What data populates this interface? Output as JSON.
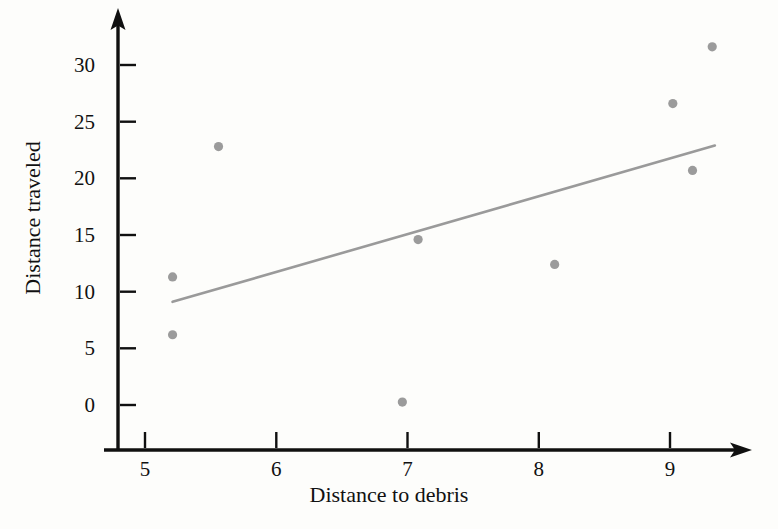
{
  "chart_data": {
    "type": "scatter",
    "title": "",
    "xlabel": "Distance to debris",
    "ylabel": "Distance traveled",
    "xlim": [
      4.62,
      9.95
    ],
    "ylim": [
      -4.0,
      33.5
    ],
    "grid": false,
    "legend": false,
    "xticks": [
      "5",
      "6",
      "7",
      "8",
      "9"
    ],
    "xtick_values": [
      5,
      6,
      7,
      8,
      9
    ],
    "yticks": [
      "0",
      "5",
      "10",
      "15",
      "20",
      "25",
      "30"
    ],
    "ytick_values": [
      0,
      5,
      10,
      15,
      20,
      25,
      30
    ],
    "point_color": "#9b9b9b",
    "line_color": "#9a9a9a",
    "axis_color": "#101010",
    "background": "#fdfdfb",
    "x": [
      5.21,
      5.21,
      5.56,
      6.96,
      7.08,
      8.12,
      9.02,
      9.17,
      9.32
    ],
    "y": [
      11.3,
      6.2,
      22.8,
      0.26,
      14.6,
      12.4,
      26.6,
      20.7,
      31.6
    ],
    "series": [
      {
        "name": "observations",
        "points": [
          {
            "x": 5.21,
            "y": 11.3
          },
          {
            "x": 5.21,
            "y": 6.2
          },
          {
            "x": 5.56,
            "y": 22.8
          },
          {
            "x": 6.96,
            "y": 0.26
          },
          {
            "x": 7.08,
            "y": 14.6
          },
          {
            "x": 8.12,
            "y": 12.4
          },
          {
            "x": 9.02,
            "y": 26.6
          },
          {
            "x": 9.17,
            "y": 20.7
          },
          {
            "x": 9.32,
            "y": 31.6
          }
        ]
      }
    ],
    "trendline": {
      "name": "regression-line",
      "x_start": 5.21,
      "y_start": 9.1,
      "x_end": 9.34,
      "y_end": 22.9,
      "slope": 3.34,
      "intercept": -8.3
    }
  }
}
